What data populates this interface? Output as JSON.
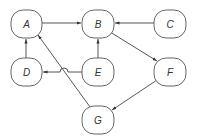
{
  "diagram": {
    "type": "directed-graph",
    "colors": {
      "stroke": "#555555",
      "edge": "#444444",
      "label": "#333333",
      "background": "#ffffff"
    },
    "nodes": [
      {
        "id": "A",
        "label": "A",
        "x": 11,
        "y": 10,
        "w": 31,
        "h": 28
      },
      {
        "id": "B",
        "label": "B",
        "x": 82,
        "y": 10,
        "w": 32,
        "h": 28
      },
      {
        "id": "C",
        "label": "C",
        "x": 154,
        "y": 10,
        "w": 32,
        "h": 28
      },
      {
        "id": "D",
        "label": "D",
        "x": 11,
        "y": 58,
        "w": 31,
        "h": 28
      },
      {
        "id": "E",
        "label": "E",
        "x": 82,
        "y": 58,
        "w": 32,
        "h": 28
      },
      {
        "id": "F",
        "label": "F",
        "x": 154,
        "y": 58,
        "w": 32,
        "h": 28
      },
      {
        "id": "G",
        "label": "G",
        "x": 82,
        "y": 106,
        "w": 32,
        "h": 28
      }
    ],
    "edges": [
      {
        "from": "A",
        "to": "B"
      },
      {
        "from": "C",
        "to": "B"
      },
      {
        "from": "D",
        "to": "A"
      },
      {
        "from": "E",
        "to": "B"
      },
      {
        "from": "E",
        "to": "D",
        "note": "line hop over G-A edge"
      },
      {
        "from": "B",
        "to": "F"
      },
      {
        "from": "F",
        "to": "G"
      },
      {
        "from": "G",
        "to": "A"
      }
    ]
  }
}
